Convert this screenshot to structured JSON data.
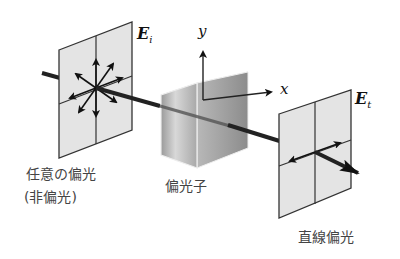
{
  "figure": {
    "labels": {
      "incident_light": "任意の偏光",
      "unpolarized_note": "(非偏光)",
      "polarizer": "偏光子",
      "linear_polarization": "直線偏光"
    },
    "symbols": {
      "incident_field": "E",
      "incident_sub": "i",
      "transmitted_field": "E",
      "transmitted_sub": "t",
      "y_axis": "y",
      "x_axis": "x"
    }
  }
}
